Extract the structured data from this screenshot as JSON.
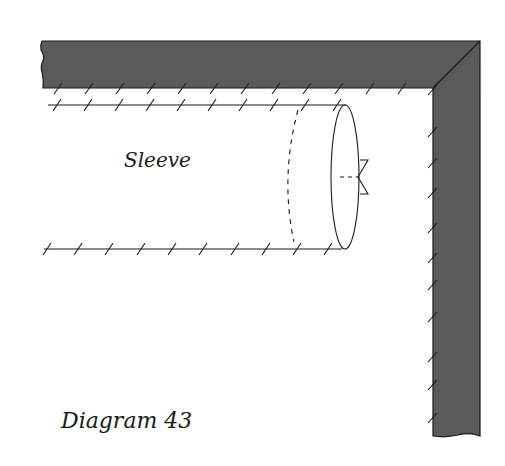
{
  "labels": {
    "sleeve": "Sleeve",
    "caption": "Diagram 43"
  },
  "colors": {
    "wall_fill": "#5a5a5a",
    "line": "#1a1a1a",
    "background": "#ffffff"
  },
  "wall": {
    "top_ticks_x": [
      58,
      89,
      120,
      151,
      182,
      214,
      245,
      276,
      307,
      339,
      370,
      402
    ],
    "right_ticks_y": [
      90,
      132,
      163,
      193,
      228,
      258,
      285,
      317,
      357,
      385,
      418
    ]
  },
  "sleeve": {
    "top_ticks_x": [
      57,
      88,
      119,
      150,
      181,
      212,
      243,
      274,
      305,
      337
    ],
    "bottom_ticks_x": [
      47,
      78,
      109,
      141,
      172,
      203,
      235,
      266,
      297,
      328
    ]
  }
}
